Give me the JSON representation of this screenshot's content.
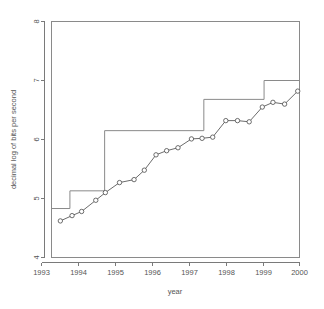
{
  "figure": {
    "background": "#ffffff",
    "foreground": "#555555",
    "width": 324,
    "height": 309
  },
  "chart_data": {
    "type": "line",
    "title": "",
    "xlabel": "year",
    "ylabel": "decimal log of bits per second",
    "xlim": [
      1993,
      2000
    ],
    "ylim": [
      4,
      8
    ],
    "xticks": [
      1993,
      1994,
      1995,
      1996,
      1997,
      1998,
      1999,
      2000
    ],
    "xticklabels": [
      "1993",
      "1994",
      "1995",
      "1996",
      "1997",
      "1998",
      "1999",
      "2000"
    ],
    "yticks": [
      4,
      5,
      6,
      7,
      8
    ],
    "yticklabels": [
      "4",
      "5",
      "6",
      "7",
      "8"
    ],
    "grid": false,
    "legend": null,
    "series": [
      {
        "name": "observed modem speed",
        "type": "line-with-markers",
        "marker": "open-circle",
        "color": "#4a4a4a",
        "x": [
          1993.25,
          1993.58,
          1993.85,
          1994.25,
          1994.52,
          1994.92,
          1995.33,
          1995.62,
          1995.95,
          1996.25,
          1996.57,
          1996.95,
          1997.25,
          1997.55,
          1997.92,
          1998.25,
          1998.58,
          1998.95,
          1999.25,
          1999.58,
          1999.95
        ],
        "y": [
          4.62,
          4.71,
          4.78,
          4.97,
          5.1,
          5.27,
          5.32,
          5.48,
          5.74,
          5.81,
          5.86,
          6.01,
          6.02,
          6.04,
          6.32,
          6.32,
          6.3,
          6.55,
          6.63,
          6.6,
          6.82
        ]
      },
      {
        "name": "step reference",
        "type": "step",
        "color": "#8a8a8a",
        "edges": [
          1993.0,
          1993.52,
          1994.5,
          1997.3,
          1999.0,
          2000.0
        ],
        "levels": [
          4.83,
          5.13,
          6.15,
          6.68,
          7.0
        ]
      }
    ]
  }
}
